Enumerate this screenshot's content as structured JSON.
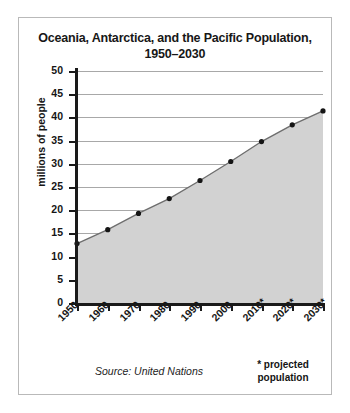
{
  "chart_data": {
    "type": "area",
    "title": "Oceania, Antarctica, and the Pacific Population, 1950–2030",
    "title_line1": "Oceania, Antarctica, and the Pacific Population,",
    "title_line2": "1950–2030",
    "xlabel": "",
    "ylabel": "millions of people",
    "ylim": [
      0,
      50
    ],
    "yticks": [
      0,
      5,
      10,
      15,
      20,
      25,
      30,
      35,
      40,
      45,
      50
    ],
    "ytick_labels": [
      "0",
      "5",
      "10",
      "15",
      "20",
      "25",
      "30",
      "35",
      "40",
      "45",
      "50"
    ],
    "grid": true,
    "legend": false,
    "categories": [
      "1950",
      "1960",
      "1970",
      "1980",
      "1990",
      "2000",
      "2010*",
      "2020*",
      "2030*"
    ],
    "x": [
      1950,
      1960,
      1970,
      1980,
      1990,
      2000,
      2010,
      2020,
      2030
    ],
    "values": [
      12.8,
      15.8,
      19.3,
      22.5,
      26.4,
      30.5,
      34.8,
      38.4,
      41.4
    ],
    "marker": "filled-circle",
    "line_color": "#6e6e6e",
    "fill_color": "#d2d2d2",
    "marker_color": "#151515",
    "axis_color": "#1a1a1a",
    "grid_color": "#a8a8a8",
    "annotations": {
      "source": "Source: United Nations",
      "projected_marker": "*",
      "projected_line1": "* projected",
      "projected_line2": "population"
    }
  }
}
